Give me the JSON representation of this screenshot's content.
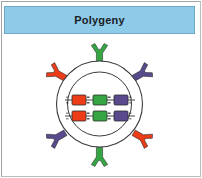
{
  "panel": {
    "title": "Polygeny",
    "banner_color": "#8ecbe9",
    "banner_border_color": "#6fa8c4",
    "title_color": "#1b2024",
    "background_color": "#ffffff",
    "frame_color": "#b9bcbe"
  },
  "diagram": {
    "name": "polygeny-cell-diagram",
    "cell_membrane": {
      "label": "cell-membrane",
      "cx": 95.5,
      "cy": 68,
      "r": 43,
      "stroke": "#3a3a3a",
      "fill": "#ffffff"
    },
    "nucleus": {
      "label": "nucleus",
      "cx": 95.5,
      "cy": 68,
      "r": 32,
      "stroke": "#3a3a3a",
      "fill": "#ffffff"
    },
    "gene_colors": {
      "red": "#ec3c18",
      "green": "#35a544",
      "purple": "#594a8e",
      "outline": "#2b2b2b",
      "strand": "#1a1a1a"
    },
    "chromosome_bars": [
      {
        "label": "chromosome-bar-top",
        "y": 59,
        "genes": [
          {
            "name": "gene-a1",
            "color_key": "red",
            "x": 68
          },
          {
            "name": "gene-b1",
            "color_key": "green",
            "x": 89
          },
          {
            "name": "gene-c1",
            "color_key": "purple",
            "x": 110
          }
        ]
      },
      {
        "label": "chromosome-bar-bottom",
        "y": 75,
        "genes": [
          {
            "name": "gene-a2",
            "color_key": "red",
            "x": 68
          },
          {
            "name": "gene-b2",
            "color_key": "green",
            "x": 89
          },
          {
            "name": "gene-c2",
            "color_key": "purple",
            "x": 110
          }
        ]
      }
    ],
    "surrounding_chromosomes": [
      {
        "name": "chromosome-top",
        "color_key": "green",
        "cx": 95.5,
        "cy": 18,
        "rotation": 0
      },
      {
        "name": "chromosome-upper-right",
        "color_key": "purple",
        "cx": 137,
        "cy": 38,
        "rotation": 60
      },
      {
        "name": "chromosome-lower-right",
        "color_key": "red",
        "cx": 137,
        "cy": 101,
        "rotation": 120
      },
      {
        "name": "chromosome-bottom",
        "color_key": "green",
        "cx": 95.5,
        "cy": 120,
        "rotation": 180
      },
      {
        "name": "chromosome-lower-left",
        "color_key": "purple",
        "cx": 54,
        "cy": 101,
        "rotation": 240
      },
      {
        "name": "chromosome-upper-left",
        "color_key": "red",
        "cx": 54,
        "cy": 38,
        "rotation": 300
      }
    ]
  }
}
